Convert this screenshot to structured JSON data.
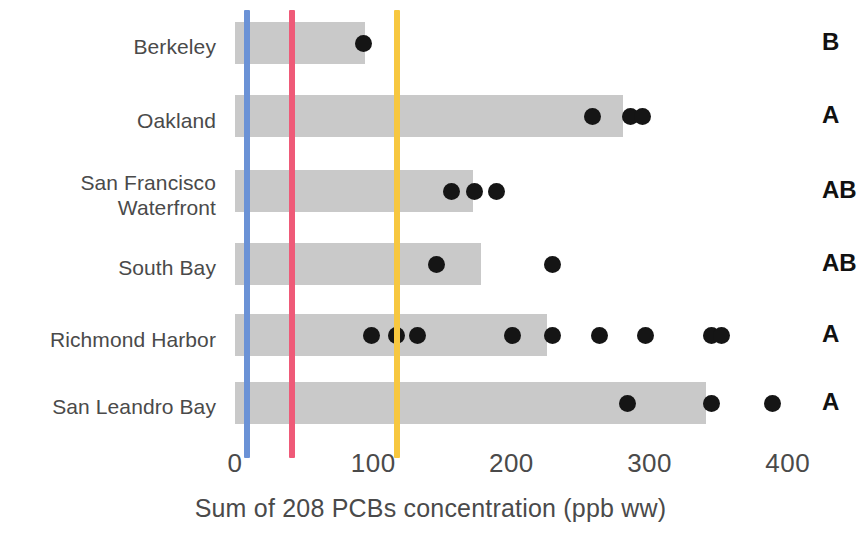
{
  "chart_data": {
    "type": "bar",
    "orientation": "horizontal",
    "title": "",
    "xlabel": "Sum of 208 PCBs concentration (ppb ww)",
    "ylabel": "",
    "xlim": [
      0,
      420
    ],
    "xticks": [
      0,
      100,
      200,
      300,
      400
    ],
    "xtick_labels": [
      "0",
      "100",
      "200",
      "300",
      "400"
    ],
    "grid": false,
    "legend": null,
    "categories": [
      "Berkeley",
      "Oakland",
      "San Francisco\nWaterfront",
      "South Bay",
      "Richmond Harbor",
      "San Leandro Bay"
    ],
    "values": [
      94,
      281,
      172,
      178,
      226,
      341
    ],
    "group_letters": [
      "B",
      "A",
      "AB",
      "AB",
      "A",
      "A"
    ],
    "points": [
      [
        93
      ],
      [
        259,
        286,
        295
      ],
      [
        157,
        173,
        189
      ],
      [
        146,
        230
      ],
      [
        99,
        117,
        132,
        201,
        230,
        264,
        297,
        345,
        352
      ],
      [
        284,
        345,
        389
      ]
    ],
    "reference_lines": [
      {
        "name": "blue-threshold",
        "value": 9,
        "color": "#6b92d6"
      },
      {
        "name": "pink-threshold",
        "value": 41,
        "color": "#ef5a78"
      },
      {
        "name": "yellow-threshold",
        "value": 117,
        "color": "#f7c73f"
      }
    ],
    "bar_color": "#c9c9c9",
    "point_color": "#151515"
  }
}
